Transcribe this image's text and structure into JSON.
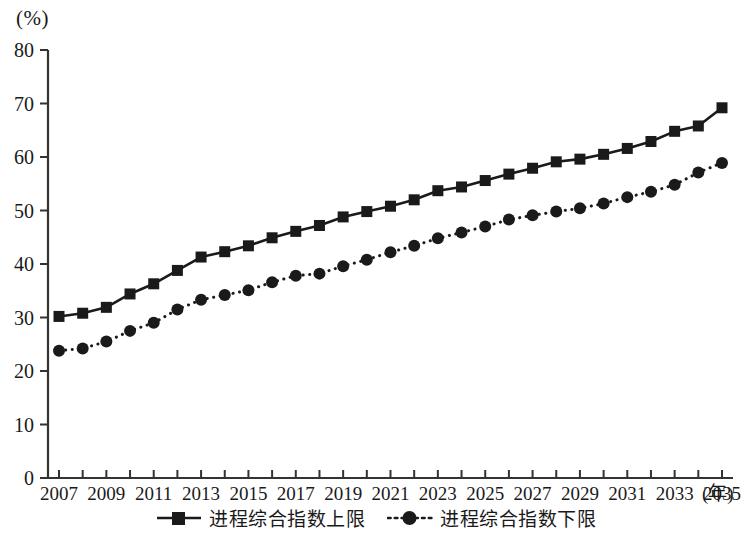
{
  "axis": {
    "unit_label": "(%)",
    "x_title": "(年)",
    "y_ticks": [
      0,
      10,
      20,
      30,
      40,
      50,
      60,
      70,
      80
    ],
    "x_ticks_labeled": [
      2007,
      2009,
      2011,
      2013,
      2015,
      2017,
      2019,
      2021,
      2023,
      2025,
      2027,
      2029,
      2031,
      2033,
      2035
    ]
  },
  "legend": {
    "items": [
      {
        "label": "进程综合指数上限",
        "marker": "square-marker",
        "line": "solid"
      },
      {
        "label": "进程综合指数下限",
        "marker": "circle-marker",
        "line": "dotted"
      }
    ]
  },
  "colors": {
    "ink": "#1a1a1a",
    "axis": "#333333",
    "background": "#ffffff"
  },
  "chart_data": {
    "type": "line",
    "title": "",
    "subtitle": "",
    "xlabel": "(年)",
    "ylabel": "(%)",
    "xlim": [
      2007,
      2035
    ],
    "ylim": [
      0,
      80
    ],
    "grid": false,
    "legend_position": "bottom-center",
    "x": [
      2007,
      2008,
      2009,
      2010,
      2011,
      2012,
      2013,
      2014,
      2015,
      2016,
      2017,
      2018,
      2019,
      2020,
      2021,
      2022,
      2023,
      2024,
      2025,
      2026,
      2027,
      2028,
      2029,
      2030,
      2031,
      2032,
      2033,
      2034,
      2035
    ],
    "series": [
      {
        "name": "进程综合指数上限",
        "marker": "square",
        "linestyle": "solid",
        "values": [
          30.2,
          30.8,
          31.9,
          34.4,
          36.3,
          38.8,
          41.3,
          42.3,
          43.4,
          44.9,
          46.1,
          47.2,
          48.8,
          49.8,
          50.8,
          52.0,
          53.7,
          54.4,
          55.6,
          56.8,
          57.9,
          59.1,
          59.6,
          60.5,
          61.6,
          62.9,
          64.8,
          65.8,
          69.2
        ]
      },
      {
        "name": "进程综合指数下限",
        "marker": "circle",
        "linestyle": "dotted",
        "values": [
          23.8,
          24.2,
          25.5,
          27.5,
          29.0,
          31.5,
          33.3,
          34.2,
          35.1,
          36.6,
          37.8,
          38.2,
          39.6,
          40.8,
          42.2,
          43.4,
          44.8,
          45.9,
          47.0,
          48.3,
          49.1,
          49.8,
          50.4,
          51.3,
          52.5,
          53.5,
          54.8,
          57.1,
          58.9
        ]
      }
    ]
  }
}
